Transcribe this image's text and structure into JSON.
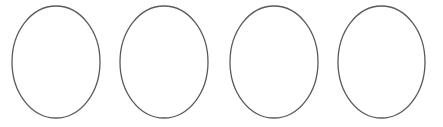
{
  "diagram": {
    "background": "#ffffff",
    "stroke_color": "#5a5a5a",
    "stroke_width": 1.3,
    "fill": "none",
    "shapes": [
      {
        "type": "ellipse",
        "cx": 56,
        "cy": 62,
        "rx": 44,
        "ry": 56
      },
      {
        "type": "ellipse",
        "cx": 164,
        "cy": 62,
        "rx": 44,
        "ry": 56
      },
      {
        "type": "ellipse",
        "cx": 274,
        "cy": 62,
        "rx": 44,
        "ry": 56
      },
      {
        "type": "ellipse",
        "cx": 381.5,
        "cy": 62,
        "rx": 43.5,
        "ry": 56
      }
    ]
  }
}
